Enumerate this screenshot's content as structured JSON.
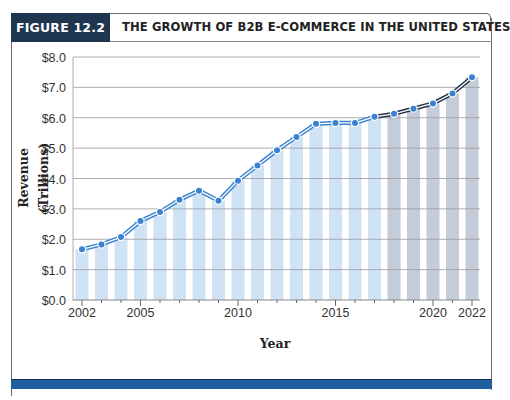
{
  "figure": {
    "label": "FIGURE 12.2",
    "title": "THE GROWTH OF B2B E-COMMERCE IN THE UNITED STATES"
  },
  "colors": {
    "label_bg": "#1f3650",
    "actual_bar": "#cfe3f5",
    "forecast_bar": "#c3ccd8",
    "actual_line": "#3a82cf",
    "forecast_line": "#24344a",
    "marker": "#3a82cf",
    "bottom_band": "#1f5f9f"
  },
  "chart_data": {
    "type": "bar",
    "title": "THE GROWTH OF B2B E-COMMERCE IN THE UNITED STATES",
    "xlabel": "Year",
    "ylabel": "Revenue (Trillions)",
    "ylim": [
      0,
      8
    ],
    "yticks": [
      "$0.0",
      "$1.0",
      "$2.0",
      "$3.0",
      "$4.0",
      "$5.0",
      "$6.0",
      "$7.0",
      "$8.0"
    ],
    "xticks": [
      "2002",
      "2005",
      "2010",
      "2015",
      "2020",
      "2022"
    ],
    "grid": true,
    "categories": [
      2002,
      2003,
      2004,
      2005,
      2006,
      2007,
      2008,
      2009,
      2010,
      2011,
      2012,
      2013,
      2014,
      2015,
      2016,
      2017,
      2018,
      2019,
      2020,
      2021,
      2022
    ],
    "series": [
      {
        "name": "Revenue (actual)",
        "style": "bars + line, light blue",
        "values": [
          1.67,
          1.83,
          2.07,
          2.6,
          2.9,
          3.3,
          3.6,
          3.27,
          3.93,
          4.43,
          4.93,
          5.37,
          5.8,
          5.83,
          5.83,
          6.03,
          null,
          null,
          null,
          null,
          null
        ]
      },
      {
        "name": "Revenue (forecast)",
        "style": "bars + line, gray",
        "values": [
          null,
          null,
          null,
          null,
          null,
          null,
          null,
          null,
          null,
          null,
          null,
          null,
          null,
          null,
          null,
          6.03,
          6.13,
          6.3,
          6.47,
          6.8,
          7.33
        ]
      }
    ]
  }
}
